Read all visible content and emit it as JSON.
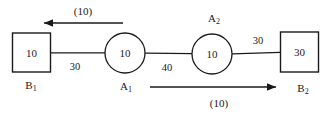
{
  "diagram": {
    "type": "network-flow-diagram",
    "stroke_color": "#1a1a1a",
    "background_color": "#ffffff",
    "nodes": [
      {
        "id": "B1",
        "shape": "square",
        "value": "10",
        "name": "B",
        "name_sub": "1",
        "cx": 31.5,
        "cy": 52.5,
        "w": 38,
        "h": 39
      },
      {
        "id": "A1",
        "shape": "circle",
        "value": "10",
        "name": "A",
        "name_sub": "1",
        "cx": 125,
        "cy": 53,
        "r": 20
      },
      {
        "id": "A2",
        "shape": "circle",
        "value": "10",
        "name": "A",
        "name_sub": "2",
        "cx": 212,
        "cy": 54,
        "r": 20
      },
      {
        "id": "B2",
        "shape": "square",
        "value": "30",
        "name": "B",
        "name_sub": "2",
        "cx": 299.5,
        "cy": 52,
        "w": 38,
        "h": 40
      }
    ],
    "edges": [
      {
        "id": "B1-A1",
        "from": "B1",
        "to": "A1",
        "capacity": "30",
        "label_x": 75,
        "label_y": 67
      },
      {
        "id": "A1-A2",
        "from": "A1",
        "to": "A2",
        "capacity": "40",
        "label_x": 167,
        "label_y": 68
      },
      {
        "id": "A2-B2",
        "from": "A2",
        "to": "B2",
        "capacity": "30",
        "label_x": 258,
        "label_y": 41
      }
    ],
    "flows": [
      {
        "id": "flow-top",
        "direction": "left",
        "label": "(10)",
        "label_x": 83,
        "label_y": 11,
        "x1": 123,
        "x2": 42,
        "y": 23
      },
      {
        "id": "flow-bottom",
        "direction": "right",
        "label": "(10)",
        "label_x": 219,
        "label_y": 103,
        "x1": 150,
        "x2": 278,
        "y": 87
      }
    ]
  }
}
